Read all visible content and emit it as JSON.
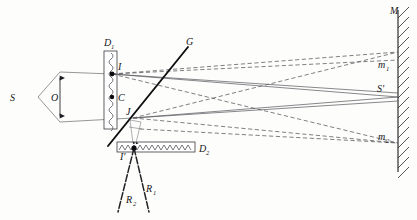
{
  "figure": {
    "type": "optics-ray-diagram",
    "width": 417,
    "height": 220,
    "colors": {
      "background": "#fdfdfb",
      "ray_solid": "#55555c",
      "ray_dashed": "#55555c",
      "ink": "#16161a",
      "thick_line": "#0e0e12"
    }
  },
  "labels": {
    "source": "S",
    "object": "O",
    "plate_one": "D",
    "plate_one_sub": "1",
    "plate_two": "D",
    "plate_two_sub": "2",
    "point_i": "I",
    "point_i_prime": "I'",
    "point_c": "C",
    "point_j": "J",
    "grating": "G",
    "mirror": "M",
    "image_s_prime": "S'",
    "mirror_point_one": "m",
    "mirror_point_one_sub": "1",
    "mirror_point_two": "m",
    "mirror_point_two_sub": "2",
    "ray_one": "R",
    "ray_one_sub": "1",
    "ray_two": "R",
    "ray_two_sub": "2"
  },
  "geometry": {
    "source_point": [
      38,
      97
    ],
    "object_top": [
      60,
      72
    ],
    "object_bottom": [
      60,
      122
    ],
    "plate_one_rect": [
      104,
      51,
      13,
      78
    ],
    "plate_two_rect": [
      117,
      142,
      78,
      10
    ],
    "point_i": [
      112,
      74
    ],
    "point_c": [
      112,
      97
    ],
    "point_j": [
      133,
      118
    ],
    "point_i_prime": [
      134,
      148
    ],
    "mirror_x": 398,
    "mirror_top": [
      398,
      10
    ],
    "mirror_bottom": [
      398,
      172
    ],
    "mirror_m1": [
      398,
      60
    ],
    "mirror_s_prime": [
      398,
      97
    ],
    "mirror_m2": [
      398,
      143
    ],
    "grating_top": [
      188,
      47
    ],
    "grating_bottom": [
      108,
      146
    ],
    "ray_r1_end": [
      149,
      212
    ],
    "ray_r2_end": [
      118,
      212
    ]
  },
  "elements": {
    "plate_one_name": "diffraction-plate-d1",
    "plate_two_name": "diffraction-plate-d2",
    "mirror_name": "mirror-m",
    "grating_name": "grating-line-g"
  }
}
